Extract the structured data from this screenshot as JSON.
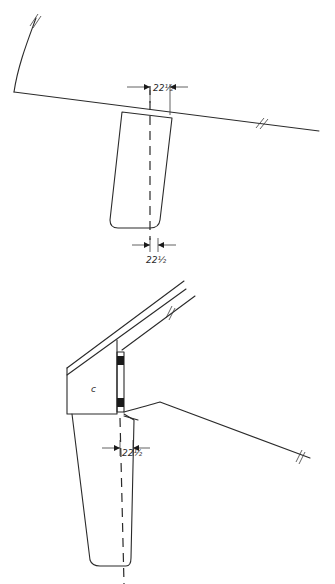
{
  "figure": {
    "type": "hand-drawn technical sketch",
    "views": [
      {
        "name": "top-view",
        "dimension_top": "22½",
        "dimension_bottom": "22½"
      },
      {
        "name": "side-view",
        "dimension": "22½",
        "small_mark": "c"
      }
    ]
  },
  "colors": {
    "ink": "#2a2a2a",
    "paper": "#ffffff"
  }
}
